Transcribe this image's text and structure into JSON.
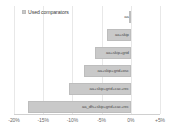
{
  "legend": {
    "label": "Used comparators",
    "swatch_color": "#c9c9c9",
    "position": "top-left"
  },
  "axis": {
    "tick_labels": [
      "-20%",
      "-15%",
      "-10%",
      "-5%",
      "0%",
      "+5%"
    ],
    "tick_values": [
      -20,
      -15,
      -10,
      -5,
      0,
      5
    ]
  },
  "chart_data": {
    "type": "bar",
    "orientation": "horizontal",
    "title": "",
    "xlabel": "",
    "ylabel": "",
    "xlim": [
      -20,
      5
    ],
    "grid": true,
    "legend_position": "top-left",
    "categories": [
      "aa",
      "aa+skip",
      "aa+skip+grid",
      "aa+skip+grid+osc",
      "aa+skip+grid+cac+rec",
      "aa_dfs+skip+grid+cac+rec"
    ],
    "values": [
      -0.3,
      -4.0,
      -6.2,
      -8.0,
      -10.6,
      -17.6
    ],
    "series": [
      {
        "name": "Used comparators",
        "values": [
          -0.3,
          -4.0,
          -6.2,
          -8.0,
          -10.6,
          -17.6
        ]
      }
    ],
    "bar_color": "#c9c9c9",
    "bar_labels": [
      "aa",
      "aa+skip",
      "aa+skip+grid",
      "aa+skip+grid+osc",
      "aa+skip+grid+cac+rec",
      "aa_dfs+skip+grid+cac+rec"
    ]
  }
}
